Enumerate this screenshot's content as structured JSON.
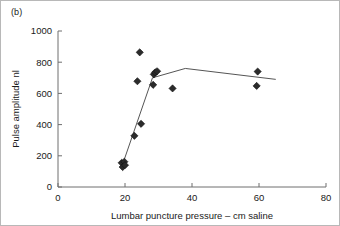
{
  "figure": {
    "panel_label": "(b)",
    "background_color": "#ffffff",
    "border_color": "#b8b8b8"
  },
  "chart_data": {
    "type": "scatter",
    "title": "",
    "subtitle": "",
    "panel": "(b)",
    "xlabel": "Lumbar puncture pressure – cm saline",
    "ylabel": "Pulse amplitude nl",
    "xlim": [
      0,
      80
    ],
    "ylim": [
      0,
      1000
    ],
    "xticks": [
      0,
      20,
      40,
      60,
      80
    ],
    "yticks": [
      0,
      200,
      400,
      600,
      800,
      1000
    ],
    "xticklabels": [
      "0",
      "20",
      "40",
      "60",
      "80"
    ],
    "yticklabels": [
      "0",
      "200",
      "400",
      "600",
      "800",
      "1000"
    ],
    "grid": false,
    "legend": null,
    "marker_style": "diamond",
    "marker_color": "#2b2b2b",
    "line_color": "#555555",
    "points": [
      {
        "x": 19.0,
        "y": 155
      },
      {
        "x": 19.3,
        "y": 128
      },
      {
        "x": 19.8,
        "y": 162
      },
      {
        "x": 20.0,
        "y": 140
      },
      {
        "x": 22.8,
        "y": 328
      },
      {
        "x": 24.4,
        "y": 863
      },
      {
        "x": 23.7,
        "y": 678
      },
      {
        "x": 24.8,
        "y": 405
      },
      {
        "x": 28.4,
        "y": 655
      },
      {
        "x": 28.6,
        "y": 722
      },
      {
        "x": 29.0,
        "y": 735
      },
      {
        "x": 29.6,
        "y": 742
      },
      {
        "x": 34.2,
        "y": 632
      },
      {
        "x": 59.3,
        "y": 648
      },
      {
        "x": 59.6,
        "y": 740
      }
    ],
    "fit_line": [
      {
        "x": 19.2,
        "y": 140
      },
      {
        "x": 28.2,
        "y": 700
      },
      {
        "x": 38.0,
        "y": 760
      },
      {
        "x": 65.0,
        "y": 690
      }
    ]
  }
}
